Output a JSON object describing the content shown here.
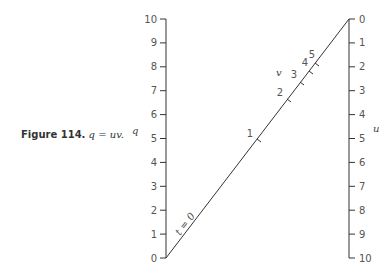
{
  "caption": {
    "figure_label": "Figure 114.",
    "equation": "q = uv."
  },
  "axes": {
    "q": {
      "name": "q",
      "ticks": [
        "0",
        "1",
        "2",
        "3",
        "4",
        "5",
        "6",
        "7",
        "8",
        "9",
        "10"
      ]
    },
    "u": {
      "name": "u",
      "ticks": [
        "0",
        "1",
        "2",
        "3",
        "4",
        "5",
        "6",
        "7",
        "8",
        "9",
        "10"
      ]
    },
    "v": {
      "name": "v",
      "ticks": [
        "1",
        "2",
        "3",
        "4",
        "5"
      ],
      "origin_label": "t = 0"
    }
  },
  "colors": {
    "line": "#333333",
    "text": "#555555"
  }
}
